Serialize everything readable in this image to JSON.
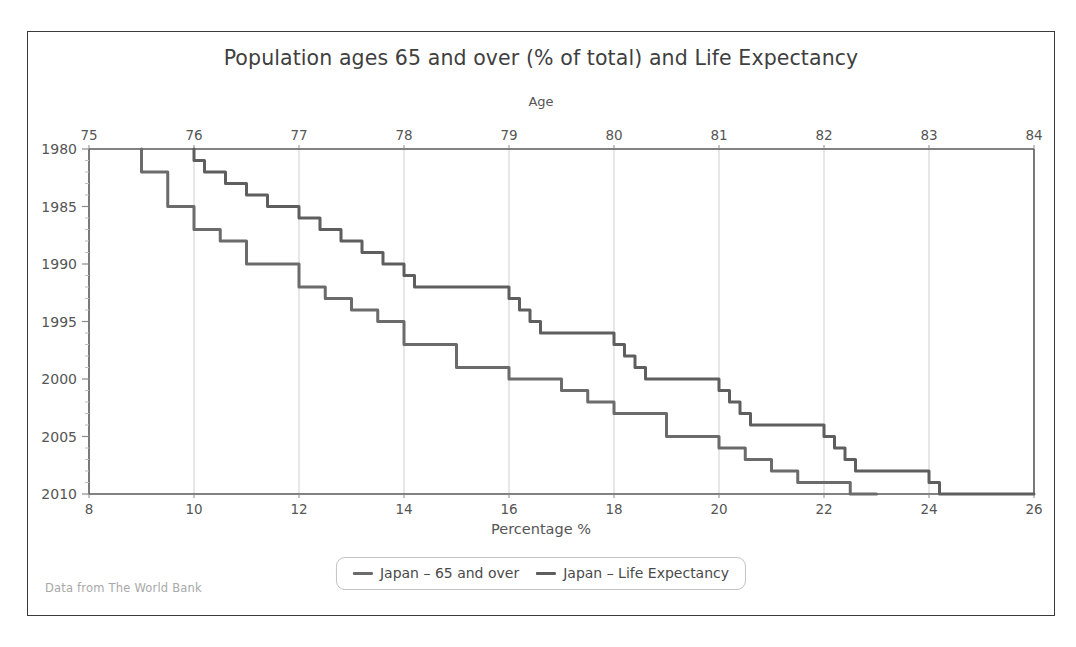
{
  "figure": {
    "title": "Population ages 65 and over (% of total) and Life Expectancy",
    "footer": "Data from The World Bank",
    "top_axis_title": "Age",
    "bottom_axis_title": "Percentage %",
    "frame_color": "#3a3a3a",
    "background": "#ffffff"
  },
  "legend": {
    "position": "bottom-center",
    "entries": [
      {
        "label": "Japan – 65 and over",
        "color": "#6b6b6b"
      },
      {
        "label": "Japan – Life Expectancy",
        "color": "#5e5e5e"
      }
    ]
  },
  "chart_data": {
    "type": "line",
    "title": "Population ages 65 and over (% of total) and Life Expectancy",
    "subtitle": "",
    "orientation": "horizontal-time",
    "grid": {
      "vertical": true,
      "horizontal": false
    },
    "xlabel": "Percentage %",
    "ylabel": "",
    "top_axis_label": "Age",
    "xlim": [
      8,
      26
    ],
    "ylim": [
      1980,
      2010
    ],
    "top_xlim": [
      75,
      84
    ],
    "x_ticks": [
      8,
      10,
      12,
      14,
      16,
      18,
      20,
      22,
      24,
      26
    ],
    "top_ticks": [
      75,
      76,
      77,
      78,
      79,
      80,
      81,
      82,
      83,
      84
    ],
    "y_ticks": [
      1980,
      1985,
      1990,
      1995,
      2000,
      2005,
      2010
    ],
    "y_minor_step": 1,
    "note": "Year axis runs downward from 1980 at top to 2010 at bottom; percentage on bottom axis, age on top axis",
    "series": [
      {
        "name": "Japan – 65 and over",
        "axis": "bottom",
        "units": "percent of total population",
        "color": "#6b6b6b",
        "step": true,
        "years": [
          1980,
          1981,
          1982,
          1983,
          1984,
          1985,
          1986,
          1987,
          1988,
          1989,
          1990,
          1991,
          1992,
          1993,
          1994,
          1995,
          1996,
          1997,
          1998,
          1999,
          2000,
          2001,
          2002,
          2003,
          2004,
          2005,
          2006,
          2007,
          2008,
          2009,
          2010
        ],
        "values": [
          9.0,
          9.0,
          9.5,
          9.5,
          9.5,
          10.0,
          10.0,
          10.5,
          11.0,
          11.0,
          12.0,
          12.0,
          12.5,
          13.0,
          13.5,
          14.0,
          14.0,
          15.0,
          15.0,
          16.0,
          17.0,
          17.5,
          18.0,
          19.0,
          19.0,
          20.0,
          20.5,
          21.0,
          21.5,
          22.5,
          23.0
        ]
      },
      {
        "name": "Japan – Life Expectancy",
        "axis": "top",
        "units": "years",
        "color": "#5e5e5e",
        "step": true,
        "years": [
          1980,
          1981,
          1982,
          1983,
          1984,
          1985,
          1986,
          1987,
          1988,
          1989,
          1990,
          1991,
          1992,
          1993,
          1994,
          1995,
          1996,
          1997,
          1998,
          1999,
          2000,
          2001,
          2002,
          2003,
          2004,
          2005,
          2006,
          2007,
          2008,
          2009,
          2010
        ],
        "values": [
          76.0,
          76.1,
          76.3,
          76.5,
          76.7,
          77.0,
          77.2,
          77.4,
          77.6,
          77.8,
          78.0,
          78.1,
          79.0,
          79.1,
          79.2,
          79.3,
          80.0,
          80.1,
          80.2,
          80.3,
          81.0,
          81.1,
          81.2,
          81.3,
          82.0,
          82.1,
          82.2,
          82.3,
          83.0,
          83.1,
          84.0
        ]
      }
    ]
  },
  "axis_geometry": {
    "plot_left": 61,
    "plot_right": 1006,
    "plot_top": 117,
    "plot_bottom": 462
  }
}
